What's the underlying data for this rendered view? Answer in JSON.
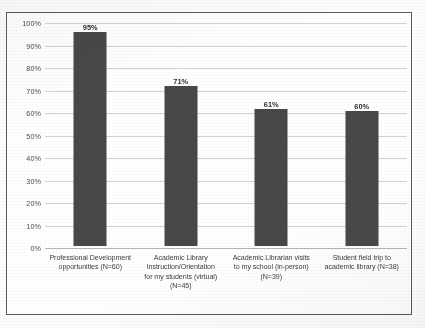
{
  "chart_data": {
    "type": "bar",
    "title": "",
    "subtitle": "",
    "xlabel": "",
    "ylabel": "",
    "ylim": [
      0,
      100
    ],
    "grid": true,
    "legend": "none",
    "orientation": "vertical",
    "bar_color": "#484848",
    "categories": [
      "Professional Development opportunities (N=60)",
      "Academic Library Instruction/Orientation for my students (virtual) (N=45)",
      "Academic Librarian visits to my school (in-person) (N=39)",
      "Student field trip to academic library (N=38)"
    ],
    "values": [
      95,
      71,
      61,
      60
    ],
    "data_labels": [
      "95%",
      "71%",
      "61%",
      "60%"
    ],
    "ytick_labels": [
      "100%",
      "90%",
      "80%",
      "70%",
      "60%",
      "50%",
      "40%",
      "30%",
      "20%",
      "10%",
      "0%"
    ],
    "ytick_values": [
      100,
      90,
      80,
      70,
      60,
      50,
      40,
      30,
      20,
      10,
      0
    ]
  },
  "categories_wrapped": [
    [
      "Professional Development",
      "opportunities (N=60)"
    ],
    [
      "Academic Library",
      "Instruction/Orientation",
      "for my students (virtual)",
      "(N=45)"
    ],
    [
      "Academic Librarian visits",
      "to my school (in-person)",
      "(N=39)"
    ],
    [
      "Student field trip to",
      "academic library (N=38)"
    ]
  ]
}
